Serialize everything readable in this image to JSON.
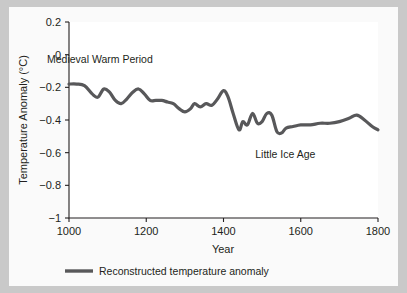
{
  "figure": {
    "background_color": "#fafafa",
    "page_background_color": "#c9c9c9",
    "plot_background_color": "#ffffff"
  },
  "chart_data": {
    "type": "line",
    "title": "",
    "subtitle": "",
    "xlabel": "Year",
    "ylabel": "Temperature Anomaly (°C)",
    "xlim": [
      1000,
      1800
    ],
    "ylim": [
      -1,
      0.2
    ],
    "grid": false,
    "legend_position": "below-axes-left",
    "line_color": "#58585a",
    "xticks": [
      1000,
      1200,
      1400,
      1600,
      1800
    ],
    "xtick_labels": [
      "1000",
      "1200",
      "1400",
      "1600",
      "1800"
    ],
    "yticks": [
      0.2,
      0,
      -0.2,
      -0.4,
      -0.6,
      -0.8,
      -1
    ],
    "ytick_labels": [
      "0.2",
      "0",
      "−0.2",
      "−0.4",
      "−0.6",
      "−0.8",
      "−1"
    ],
    "series": [
      {
        "name": "Reconstructed temperature anomaly",
        "color": "#58585a",
        "x": [
          1000,
          1020,
          1040,
          1060,
          1075,
          1090,
          1105,
          1120,
          1135,
          1150,
          1165,
          1180,
          1195,
          1210,
          1225,
          1240,
          1255,
          1270,
          1285,
          1300,
          1315,
          1325,
          1340,
          1355,
          1370,
          1385,
          1400,
          1412,
          1425,
          1440,
          1450,
          1462,
          1475,
          1488,
          1500,
          1512,
          1525,
          1538,
          1550,
          1562,
          1580,
          1600,
          1625,
          1650,
          1675,
          1700,
          1725,
          1745,
          1765,
          1785,
          1800
        ],
        "y": [
          -0.18,
          -0.18,
          -0.19,
          -0.24,
          -0.26,
          -0.21,
          -0.23,
          -0.28,
          -0.3,
          -0.27,
          -0.23,
          -0.21,
          -0.24,
          -0.28,
          -0.28,
          -0.28,
          -0.29,
          -0.3,
          -0.33,
          -0.35,
          -0.33,
          -0.3,
          -0.32,
          -0.3,
          -0.31,
          -0.27,
          -0.22,
          -0.26,
          -0.36,
          -0.46,
          -0.41,
          -0.43,
          -0.36,
          -0.42,
          -0.41,
          -0.36,
          -0.37,
          -0.47,
          -0.48,
          -0.45,
          -0.44,
          -0.43,
          -0.43,
          -0.42,
          -0.42,
          -0.41,
          -0.39,
          -0.37,
          -0.4,
          -0.44,
          -0.46
        ]
      }
    ],
    "annotations": [
      {
        "text": "Medieval Warm Period",
        "x": 1080,
        "y": -0.05
      },
      {
        "text": "Little Ice Age",
        "x": 1560,
        "y": -0.63
      }
    ]
  },
  "legend": {
    "entries": [
      {
        "label": "Reconstructed temperature anomaly",
        "color": "#58585a"
      }
    ]
  }
}
